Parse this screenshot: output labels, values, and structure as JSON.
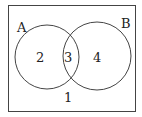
{
  "diagram": {
    "type": "venn",
    "universe_region_label": "1",
    "sets": [
      {
        "name": "A",
        "only_region_label": "2"
      },
      {
        "name": "B",
        "only_region_label": "4"
      }
    ],
    "intersection_label": "3",
    "colors": {
      "stroke": "#333333",
      "background": "#ffffff"
    }
  }
}
